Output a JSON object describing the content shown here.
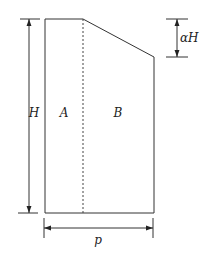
{
  "diagram": {
    "title": "",
    "regions": [
      {
        "id": "A",
        "label": "A"
      },
      {
        "id": "B",
        "label": "B"
      }
    ],
    "dimensions": {
      "height_label": "H",
      "alpha_height_label": "αH",
      "width_label": "p"
    },
    "colors": {
      "line": "#333333",
      "background": "#ffffff"
    }
  }
}
